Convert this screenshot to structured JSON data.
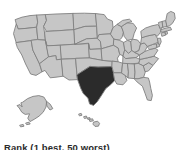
{
  "figure": {
    "caption": "Rank (1 best, 50 worst)",
    "colors": {
      "background": "#ffffff",
      "state_fill": "#c6c6c6",
      "highlight_fill": "#2b2b2b",
      "border": "#808080",
      "caption_text": "#2b2b2b"
    }
  },
  "map_data": {
    "type": "choropleth",
    "region": "United States",
    "projection": "albers-usa",
    "highlighted_states": [
      "Texas"
    ],
    "legend": "Rank (1 best, 50 worst)",
    "insets": [
      "Alaska",
      "Hawaii"
    ],
    "states": [
      {
        "code": "WA",
        "name": "Washington",
        "highlighted": false
      },
      {
        "code": "OR",
        "name": "Oregon",
        "highlighted": false
      },
      {
        "code": "CA",
        "name": "California",
        "highlighted": false
      },
      {
        "code": "NV",
        "name": "Nevada",
        "highlighted": false
      },
      {
        "code": "ID",
        "name": "Idaho",
        "highlighted": false
      },
      {
        "code": "MT",
        "name": "Montana",
        "highlighted": false
      },
      {
        "code": "WY",
        "name": "Wyoming",
        "highlighted": false
      },
      {
        "code": "UT",
        "name": "Utah",
        "highlighted": false
      },
      {
        "code": "AZ",
        "name": "Arizona",
        "highlighted": false
      },
      {
        "code": "CO",
        "name": "Colorado",
        "highlighted": false
      },
      {
        "code": "NM",
        "name": "New Mexico",
        "highlighted": false
      },
      {
        "code": "ND",
        "name": "North Dakota",
        "highlighted": false
      },
      {
        "code": "SD",
        "name": "South Dakota",
        "highlighted": false
      },
      {
        "code": "NE",
        "name": "Nebraska",
        "highlighted": false
      },
      {
        "code": "KS",
        "name": "Kansas",
        "highlighted": false
      },
      {
        "code": "OK",
        "name": "Oklahoma",
        "highlighted": false
      },
      {
        "code": "TX",
        "name": "Texas",
        "highlighted": true
      },
      {
        "code": "MN",
        "name": "Minnesota",
        "highlighted": false
      },
      {
        "code": "IA",
        "name": "Iowa",
        "highlighted": false
      },
      {
        "code": "MO",
        "name": "Missouri",
        "highlighted": false
      },
      {
        "code": "AR",
        "name": "Arkansas",
        "highlighted": false
      },
      {
        "code": "LA",
        "name": "Louisiana",
        "highlighted": false
      },
      {
        "code": "WI",
        "name": "Wisconsin",
        "highlighted": false
      },
      {
        "code": "IL",
        "name": "Illinois",
        "highlighted": false
      },
      {
        "code": "MI",
        "name": "Michigan",
        "highlighted": false
      },
      {
        "code": "IN",
        "name": "Indiana",
        "highlighted": false
      },
      {
        "code": "OH",
        "name": "Ohio",
        "highlighted": false
      },
      {
        "code": "KY",
        "name": "Kentucky",
        "highlighted": false
      },
      {
        "code": "TN",
        "name": "Tennessee",
        "highlighted": false
      },
      {
        "code": "MS",
        "name": "Mississippi",
        "highlighted": false
      },
      {
        "code": "AL",
        "name": "Alabama",
        "highlighted": false
      },
      {
        "code": "GA",
        "name": "Georgia",
        "highlighted": false
      },
      {
        "code": "FL",
        "name": "Florida",
        "highlighted": false
      },
      {
        "code": "SC",
        "name": "South Carolina",
        "highlighted": false
      },
      {
        "code": "NC",
        "name": "North Carolina",
        "highlighted": false
      },
      {
        "code": "VA",
        "name": "Virginia",
        "highlighted": false
      },
      {
        "code": "WV",
        "name": "West Virginia",
        "highlighted": false
      },
      {
        "code": "MD",
        "name": "Maryland",
        "highlighted": false
      },
      {
        "code": "DE",
        "name": "Delaware",
        "highlighted": false
      },
      {
        "code": "NJ",
        "name": "New Jersey",
        "highlighted": false
      },
      {
        "code": "PA",
        "name": "Pennsylvania",
        "highlighted": false
      },
      {
        "code": "NY",
        "name": "New York",
        "highlighted": false
      },
      {
        "code": "CT",
        "name": "Connecticut",
        "highlighted": false
      },
      {
        "code": "RI",
        "name": "Rhode Island",
        "highlighted": false
      },
      {
        "code": "MA",
        "name": "Massachusetts",
        "highlighted": false
      },
      {
        "code": "VT",
        "name": "Vermont",
        "highlighted": false
      },
      {
        "code": "NH",
        "name": "New Hampshire",
        "highlighted": false
      },
      {
        "code": "ME",
        "name": "Maine",
        "highlighted": false
      },
      {
        "code": "AK",
        "name": "Alaska",
        "highlighted": false
      },
      {
        "code": "HI",
        "name": "Hawaii",
        "highlighted": false
      }
    ]
  }
}
